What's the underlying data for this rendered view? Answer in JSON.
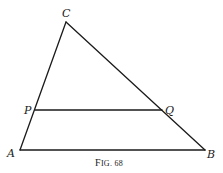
{
  "figure": {
    "caption_prefix": "F",
    "caption_rest": "IG. 68",
    "points": {
      "A": {
        "label": "A",
        "x": 20,
        "y": 150
      },
      "B": {
        "label": "B",
        "x": 205,
        "y": 150
      },
      "C": {
        "label": "C",
        "x": 66,
        "y": 22
      },
      "P": {
        "label": "P",
        "x": 35,
        "y": 110
      },
      "Q": {
        "label": "Q",
        "x": 162,
        "y": 110
      }
    },
    "segments": [
      "AB",
      "BC",
      "CA",
      "PQ"
    ],
    "line_color": "#1a1a1a"
  }
}
